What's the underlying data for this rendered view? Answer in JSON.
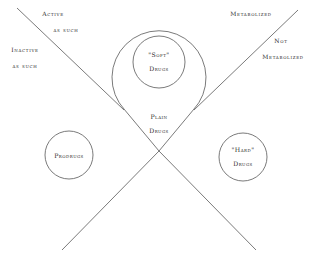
{
  "diagram": {
    "line_color": "#6b6b6b",
    "text_color": "#2c2c2c",
    "background": "#ffffff",
    "center_circle": {
      "name": "plain-drugs",
      "line1": "Plain",
      "line2": "Drugs"
    },
    "satellites": [
      {
        "name": "soft-drugs",
        "line1": "\"Soft\"",
        "line2": "Drugs"
      },
      {
        "name": "prodrugs",
        "line1": "Prodrugs",
        "line2": ""
      },
      {
        "name": "hard-drugs",
        "line1": "\"Hard\"",
        "line2": "Drugs"
      }
    ],
    "quadrant_labels": [
      {
        "name": "active-as-such",
        "line1": "Active",
        "line2": "as such"
      },
      {
        "name": "inactive-as-such",
        "line1": "Inactive",
        "line2": "as such"
      },
      {
        "name": "metabolized",
        "line1": "Metabolized",
        "line2": ""
      },
      {
        "name": "not-metabolized",
        "line1": "Not",
        "line2": "Metabolized"
      }
    ]
  }
}
